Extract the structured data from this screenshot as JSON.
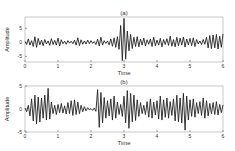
{
  "chart_data": [
    {
      "type": "line",
      "title": "(a)",
      "xlabel": "Time",
      "ylabel": "Amplitude",
      "xlim": [
        0,
        6
      ],
      "ylim": [
        -7,
        9
      ],
      "xticks": [
        "0",
        "1",
        "2",
        "3",
        "4",
        "5",
        "6"
      ],
      "yticks": [
        "-5",
        "0",
        "5"
      ],
      "ytick_values": [
        -5,
        0,
        5
      ],
      "grid": false,
      "line_color": "#222222",
      "series": [
        {
          "name": "signal-a",
          "x": [
            0.0,
            0.05,
            0.1,
            0.15,
            0.2,
            0.25,
            0.3,
            0.35,
            0.4,
            0.45,
            0.5,
            0.55,
            0.6,
            0.65,
            0.7,
            0.75,
            0.8,
            0.85,
            0.9,
            0.95,
            1.0,
            1.05,
            1.1,
            1.15,
            1.2,
            1.25,
            1.3,
            1.35,
            1.4,
            1.45,
            1.5,
            1.55,
            1.6,
            1.65,
            1.7,
            1.75,
            1.8,
            1.85,
            1.9,
            1.95,
            2.0,
            2.05,
            2.1,
            2.15,
            2.2,
            2.25,
            2.3,
            2.35,
            2.4,
            2.45,
            2.5,
            2.55,
            2.6,
            2.65,
            2.7,
            2.75,
            2.8,
            2.85,
            2.9,
            2.95,
            3.0,
            3.05,
            3.1,
            3.15,
            3.2,
            3.25,
            3.3,
            3.35,
            3.4,
            3.45,
            3.5,
            3.55,
            3.6,
            3.65,
            3.7,
            3.75,
            3.8,
            3.85,
            3.9,
            3.95,
            4.0,
            4.05,
            4.1,
            4.15,
            4.2,
            4.25,
            4.3,
            4.35,
            4.4,
            4.45,
            4.5,
            4.55,
            4.6,
            4.65,
            4.7,
            4.75,
            4.8,
            4.85,
            4.9,
            4.95,
            5.0,
            5.05,
            5.1,
            5.15,
            5.2,
            5.25,
            5.3,
            5.35,
            5.4,
            5.45,
            5.5,
            5.55,
            5.6,
            5.65,
            5.7,
            5.75,
            5.8,
            5.85,
            5.9,
            5.95,
            6.0
          ],
          "y": [
            0.3,
            -0.8,
            1.2,
            -1.0,
            0.6,
            -1.5,
            2.0,
            -1.8,
            1.4,
            -0.9,
            0.8,
            -1.2,
            1.0,
            -0.6,
            0.5,
            -1.1,
            1.3,
            -0.8,
            0.7,
            -1.0,
            1.5,
            -1.3,
            0.9,
            -0.5,
            0.4,
            -0.7,
            0.6,
            -0.3,
            0.4,
            -0.5,
            0.8,
            -1.0,
            1.6,
            -1.2,
            0.9,
            -0.7,
            0.5,
            -0.6,
            0.8,
            -0.5,
            0.6,
            -0.4,
            0.3,
            -0.8,
            1.1,
            -1.3,
            1.8,
            -1.0,
            0.6,
            -0.4,
            0.5,
            -0.9,
            1.2,
            -1.4,
            1.6,
            -1.8,
            2.0,
            -2.5,
            6.0,
            -6.5,
            8.5,
            -6.0,
            4.0,
            -3.0,
            2.8,
            -2.2,
            1.8,
            -1.5,
            2.0,
            -1.6,
            1.2,
            -1.0,
            1.5,
            -1.3,
            0.9,
            -0.7,
            1.2,
            -1.5,
            1.8,
            -1.2,
            0.8,
            -1.0,
            1.4,
            -1.6,
            1.0,
            -0.8,
            1.3,
            -1.1,
            2.2,
            -1.4,
            1.0,
            -1.6,
            1.8,
            -1.2,
            1.5,
            -1.0,
            1.9,
            -1.7,
            1.2,
            -0.9,
            1.4,
            -1.2,
            1.6,
            -1.5,
            1.0,
            -0.6,
            0.5,
            -0.8,
            1.0,
            -0.7,
            1.8,
            -2.0,
            2.4,
            -2.2,
            2.6,
            -2.0,
            2.8,
            -2.4,
            2.2,
            -1.8,
            3.0
          ]
        }
      ]
    },
    {
      "type": "line",
      "title": "(b)",
      "xlabel": "Time",
      "ylabel": "Amplitude",
      "xlim": [
        0,
        6
      ],
      "ylim": [
        -5,
        5
      ],
      "xticks": [
        "0",
        "1",
        "2",
        "3",
        "4",
        "5",
        "6"
      ],
      "yticks": [
        "-5",
        "0",
        "5"
      ],
      "ytick_values": [
        -5,
        0,
        5
      ],
      "grid": false,
      "line_color": "#222222",
      "series": [
        {
          "name": "signal-b",
          "x": [
            0.0,
            0.05,
            0.1,
            0.15,
            0.2,
            0.25,
            0.3,
            0.35,
            0.4,
            0.45,
            0.5,
            0.55,
            0.6,
            0.65,
            0.7,
            0.75,
            0.8,
            0.85,
            0.9,
            0.95,
            1.0,
            1.05,
            1.1,
            1.15,
            1.2,
            1.25,
            1.3,
            1.35,
            1.4,
            1.45,
            1.5,
            1.55,
            1.6,
            1.65,
            1.7,
            1.75,
            1.8,
            1.85,
            1.9,
            1.95,
            2.0,
            2.05,
            2.1,
            2.15,
            2.2,
            2.25,
            2.3,
            2.35,
            2.4,
            2.45,
            2.5,
            2.55,
            2.6,
            2.65,
            2.7,
            2.75,
            2.8,
            2.85,
            2.9,
            2.95,
            3.0,
            3.05,
            3.1,
            3.15,
            3.2,
            3.25,
            3.3,
            3.35,
            3.4,
            3.45,
            3.5,
            3.55,
            3.6,
            3.65,
            3.7,
            3.75,
            3.8,
            3.85,
            3.9,
            3.95,
            4.0,
            4.05,
            4.1,
            4.15,
            4.2,
            4.25,
            4.3,
            4.35,
            4.4,
            4.45,
            4.5,
            4.55,
            4.6,
            4.65,
            4.7,
            4.75,
            4.8,
            4.85,
            4.9,
            4.95,
            5.0,
            5.05,
            5.1,
            5.15,
            5.2,
            5.25,
            5.3,
            5.35,
            5.4,
            5.45,
            5.5,
            5.55,
            5.6,
            5.65,
            5.7,
            5.75,
            5.8,
            5.85,
            5.9,
            5.95,
            6.0
          ],
          "y": [
            0.2,
            -0.6,
            0.8,
            -1.5,
            2.2,
            -2.6,
            3.0,
            -3.2,
            2.6,
            -2.8,
            2.4,
            -2.0,
            3.0,
            -2.4,
            4.5,
            -2.2,
            1.5,
            -1.0,
            0.8,
            -1.2,
            1.0,
            -0.8,
            1.2,
            -0.9,
            0.7,
            -1.1,
            1.4,
            -1.0,
            1.8,
            -1.4,
            2.0,
            -1.2,
            1.5,
            -1.0,
            0.8,
            -0.6,
            0.5,
            -0.4,
            0.3,
            -0.2,
            0.1,
            -0.3,
            0.2,
            -0.5,
            4.2,
            -4.0,
            3.6,
            -3.0,
            2.5,
            -2.0,
            1.8,
            -1.5,
            2.2,
            -2.4,
            2.8,
            -2.0,
            1.5,
            -1.2,
            1.0,
            -1.6,
            2.8,
            -3.0,
            4.0,
            -4.2,
            3.4,
            -2.8,
            3.0,
            -2.5,
            2.0,
            -1.6,
            1.4,
            -1.0,
            0.8,
            -1.2,
            1.6,
            -1.8,
            2.2,
            -2.0,
            1.5,
            -1.3,
            1.8,
            -2.2,
            2.8,
            -2.4,
            2.0,
            -1.8,
            2.4,
            -2.0,
            1.6,
            -1.4,
            2.2,
            -2.6,
            3.0,
            -2.8,
            2.4,
            -3.0,
            3.4,
            -4.6,
            2.8,
            -2.4,
            2.0,
            -1.6,
            2.2,
            -1.8,
            1.4,
            -1.0,
            1.6,
            -1.4,
            2.4,
            -2.0,
            1.8,
            -1.5,
            1.2,
            -1.0,
            1.4,
            -1.2,
            1.6,
            -1.3,
            1.0,
            -0.8,
            0.9
          ]
        }
      ]
    }
  ]
}
